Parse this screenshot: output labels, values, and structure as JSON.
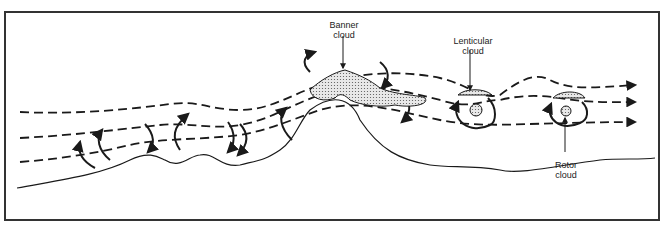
{
  "diagram": {
    "labels": {
      "banner": {
        "line1": "Banner",
        "line2": "cloud"
      },
      "lenticular": {
        "line1": "Lenticular",
        "line2": "cloud"
      },
      "rotor": {
        "line1": "Rotor",
        "line2": "cloud"
      }
    },
    "colors": {
      "line": "#1a1a1a",
      "cloud_fill": "#d8d8d8",
      "frame": "#333333",
      "background": "#ffffff"
    }
  }
}
